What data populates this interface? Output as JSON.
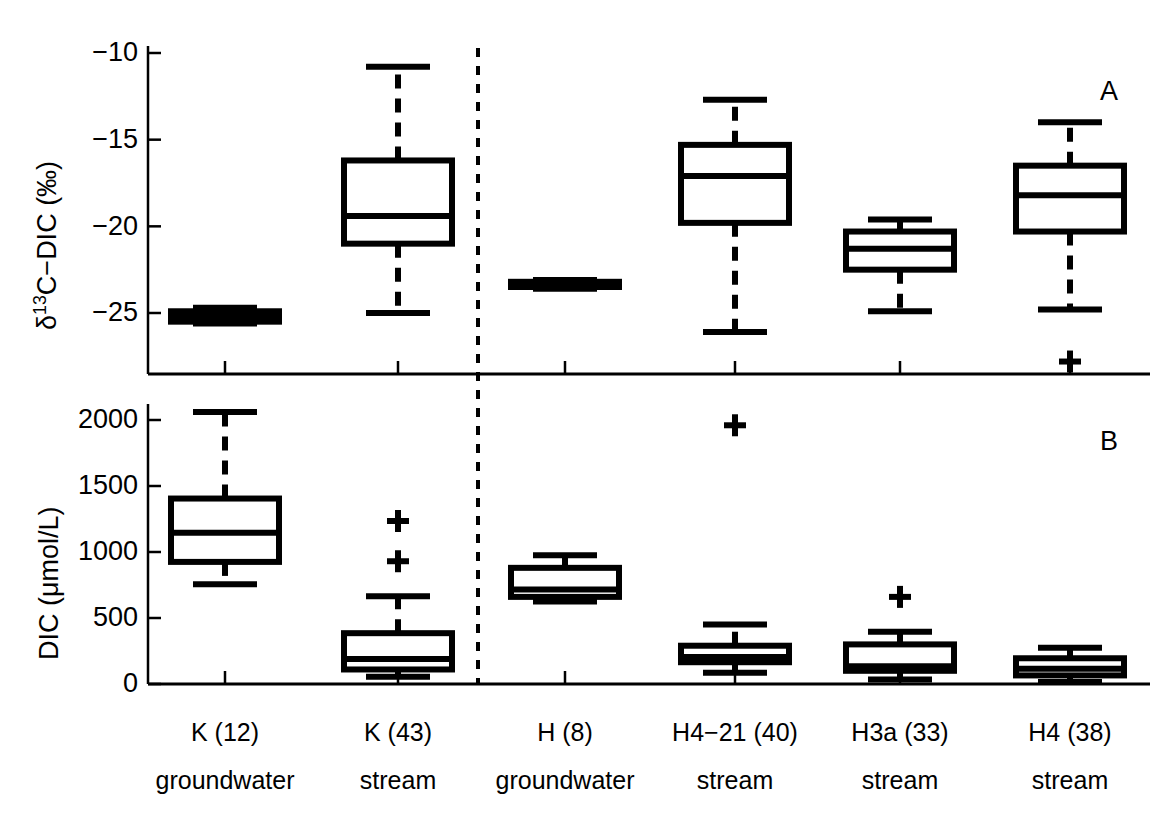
{
  "figure": {
    "width": 1175,
    "height": 819,
    "background": "#ffffff",
    "line_color": "#000000",
    "divider_note": "vertical dashed line separating K catchment from H catchment"
  },
  "panels": {
    "a": {
      "letter": "A",
      "ylabel_prefix": "δ",
      "ylabel_sup": "13",
      "ylabel_suffix": "C−DIC (‰)",
      "ylabel_full": "δ13C−DIC (‰)",
      "ytick_labels": [
        "−10",
        "−15",
        "−20",
        "−25"
      ]
    },
    "b": {
      "letter": "B",
      "ylabel_full": "DIC (μmol/L)",
      "ytick_labels": [
        "2000",
        "1500",
        "1000",
        "500",
        "0"
      ]
    }
  },
  "categories": [
    {
      "name": "K (12)",
      "type": "groundwater"
    },
    {
      "name": "K (43)",
      "type": "stream"
    },
    {
      "name": "H (8)",
      "type": "groundwater"
    },
    {
      "name": "H4−21 (40)",
      "type": "stream"
    },
    {
      "name": "H3a (33)",
      "type": "stream"
    },
    {
      "name": "H4 (38)",
      "type": "stream"
    }
  ],
  "chart_data": [
    {
      "type": "box",
      "panel": "A",
      "title": "",
      "ylabel": "δ13C−DIC (‰)",
      "xlabel": "",
      "ylim": [
        -28.5,
        -9.0
      ],
      "yticks": [
        -10,
        -15,
        -20,
        -25
      ],
      "grid": false,
      "legend": "none",
      "categories": [
        "K (12) groundwater",
        "K (43) stream",
        "H (8) groundwater",
        "H4−21 (40) stream",
        "H3a (33) stream",
        "H4 (38) stream"
      ],
      "boxes": [
        {
          "category": "K (12) groundwater",
          "whisker_low": -25.6,
          "q1": -25.5,
          "median": -25.2,
          "q3": -24.9,
          "whisker_high": -24.7,
          "outliers": []
        },
        {
          "category": "K (43) stream",
          "whisker_low": -25.0,
          "q1": -21.0,
          "median": -19.4,
          "q3": -16.2,
          "whisker_high": -10.8,
          "outliers": []
        },
        {
          "category": "H (8) groundwater",
          "whisker_low": -23.6,
          "q1": -23.5,
          "median": -23.4,
          "q3": -23.2,
          "whisker_high": -23.1,
          "outliers": []
        },
        {
          "category": "H4−21 (40) stream",
          "whisker_low": -26.1,
          "q1": -19.8,
          "median": -17.1,
          "q3": -15.3,
          "whisker_high": -12.7,
          "outliers": []
        },
        {
          "category": "H3a (33) stream",
          "whisker_low": -24.9,
          "q1": -22.5,
          "median": -21.3,
          "q3": -20.3,
          "whisker_high": -19.6,
          "outliers": []
        },
        {
          "category": "H4 (38) stream",
          "whisker_low": -24.8,
          "q1": -20.3,
          "median": -18.2,
          "q3": -16.5,
          "whisker_high": -14.0,
          "outliers": [
            -27.8
          ]
        }
      ]
    },
    {
      "type": "box",
      "panel": "B",
      "title": "",
      "ylabel": "DIC (μmol/L)",
      "xlabel": "",
      "ylim": [
        -60,
        2150
      ],
      "yticks": [
        0,
        500,
        1000,
        1500,
        2000
      ],
      "grid": false,
      "legend": "none",
      "categories": [
        "K (12) groundwater",
        "K (43) stream",
        "H (8) groundwater",
        "H4−21 (40) stream",
        "H3a (33) stream",
        "H4 (38) stream"
      ],
      "boxes": [
        {
          "category": "K (12) groundwater",
          "whisker_low": 755,
          "q1": 925,
          "median": 1145,
          "q3": 1405,
          "whisker_high": 2060,
          "outliers": []
        },
        {
          "category": "K (43) stream",
          "whisker_low": 55,
          "q1": 110,
          "median": 190,
          "q3": 385,
          "whisker_high": 665,
          "outliers": [
            930,
            1235
          ]
        },
        {
          "category": "H (8) groundwater",
          "whisker_low": 625,
          "q1": 660,
          "median": 715,
          "q3": 880,
          "whisker_high": 975,
          "outliers": []
        },
        {
          "category": "H4−21 (40) stream",
          "whisker_low": 85,
          "q1": 165,
          "median": 205,
          "q3": 290,
          "whisker_high": 450,
          "outliers": [
            1960
          ]
        },
        {
          "category": "H3a (33) stream",
          "whisker_low": 35,
          "q1": 100,
          "median": 135,
          "q3": 300,
          "whisker_high": 395,
          "outliers": [
            660
          ]
        },
        {
          "category": "H4 (38) stream",
          "whisker_low": 15,
          "q1": 65,
          "median": 115,
          "q3": 195,
          "whisker_high": 275,
          "outliers": []
        }
      ]
    }
  ]
}
